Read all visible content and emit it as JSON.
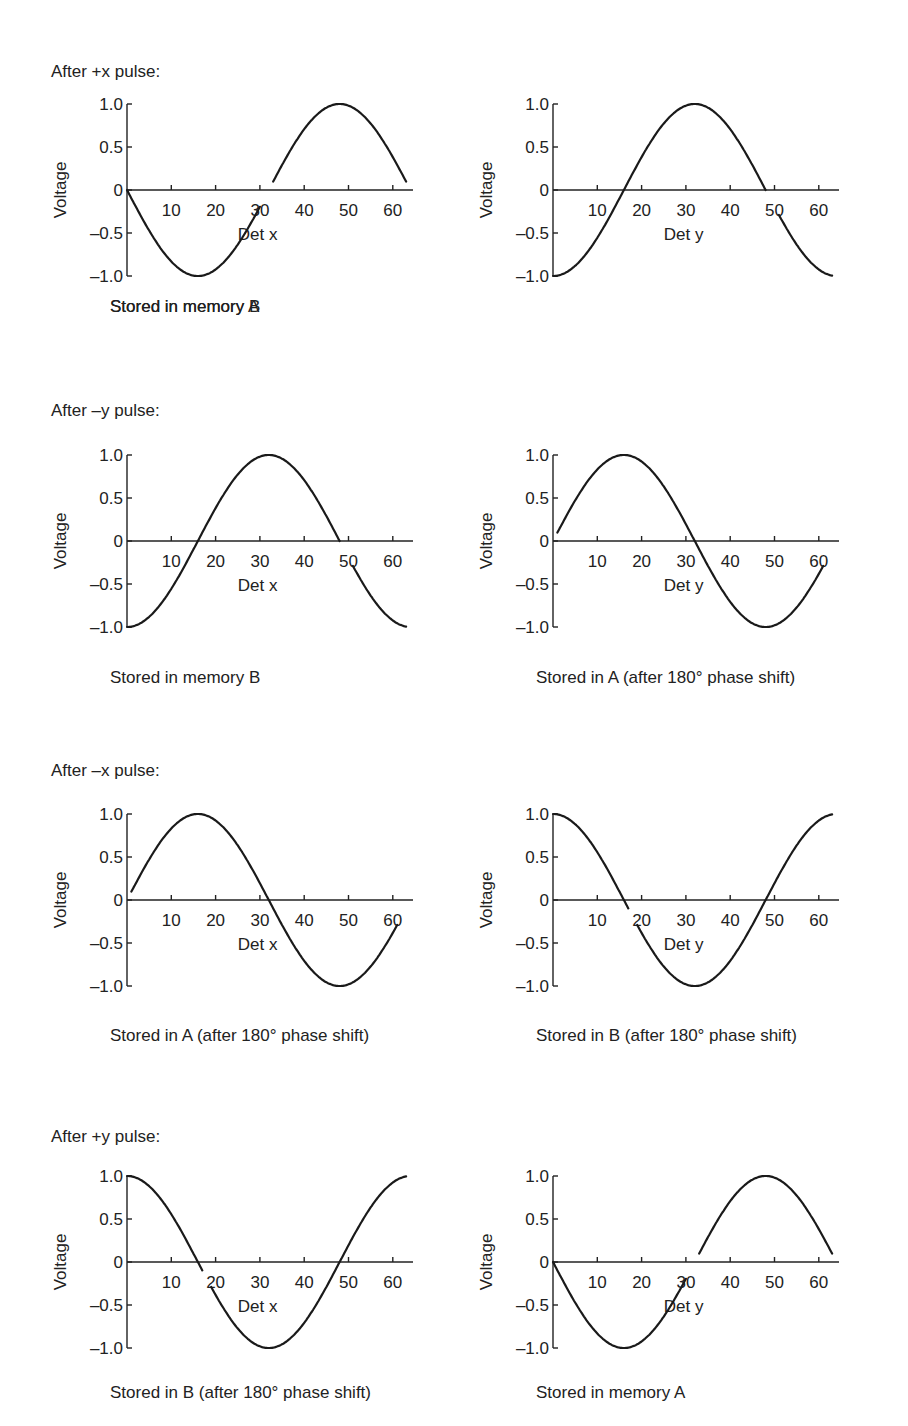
{
  "figure": {
    "rows": [
      {
        "title": "After +x pulse:"
      },
      {
        "title": "After –y pulse:"
      },
      {
        "title": "After –x pulse:"
      },
      {
        "title": "After +y pulse:"
      }
    ],
    "y_axis_label": "Voltage",
    "y_tick_labels": [
      "1.0",
      "0.5",
      "0",
      "–0.5",
      "–1.0"
    ],
    "x_tick_labels": [
      "10",
      "20",
      "30",
      "40",
      "50",
      "60"
    ]
  },
  "chart_data": [
    {
      "type": "line",
      "row": 0,
      "col": 0,
      "row_title": "After +x pulse:",
      "xlabel": "Det x",
      "ylabel": "Voltage",
      "caption": "Stored in memory A",
      "xlim": [
        0,
        64
      ],
      "ylim": [
        -1.0,
        1.0
      ],
      "xticks": [
        10,
        20,
        30,
        40,
        50,
        60
      ],
      "yticks": [
        -1.0,
        -0.5,
        0,
        0.5,
        1.0
      ],
      "function": "-sin(2*pi*x/64)",
      "x": [
        0,
        8,
        16,
        24,
        32,
        40,
        48,
        56,
        63
      ],
      "y": [
        0,
        -0.71,
        -1.0,
        -0.71,
        0,
        0.71,
        1.0,
        0.71,
        0.1
      ],
      "gap_near_label": [
        30,
        33
      ]
    },
    {
      "type": "line",
      "row": 0,
      "col": 1,
      "xlabel": "Det y",
      "ylabel": "Voltage",
      "caption": "Stored in memory B",
      "xlim": [
        0,
        64
      ],
      "ylim": [
        -1.0,
        1.0
      ],
      "xticks": [
        10,
        20,
        30,
        40,
        50,
        60
      ],
      "yticks": [
        -1.0,
        -0.5,
        0,
        0.5,
        1.0
      ],
      "function": "-cos(2*pi*x/64)",
      "x": [
        0,
        8,
        16,
        24,
        32,
        40,
        48,
        56,
        63
      ],
      "y": [
        -1.0,
        -0.71,
        0,
        0.71,
        1.0,
        0.71,
        0,
        -0.71,
        -1.0
      ],
      "gap_near_label": [
        48,
        51
      ]
    },
    {
      "type": "line",
      "row": 1,
      "col": 0,
      "row_title": "After –y pulse:",
      "xlabel": "Det x",
      "ylabel": "Voltage",
      "caption": "Stored in memory B",
      "xlim": [
        0,
        64
      ],
      "ylim": [
        -1.0,
        1.0
      ],
      "xticks": [
        10,
        20,
        30,
        40,
        50,
        60
      ],
      "yticks": [
        -1.0,
        -0.5,
        0,
        0.5,
        1.0
      ],
      "function": "-cos(2*pi*x/64)",
      "x": [
        0,
        8,
        16,
        24,
        32,
        40,
        48,
        56,
        63
      ],
      "y": [
        -1.0,
        -0.71,
        0,
        0.71,
        1.0,
        0.71,
        0,
        -0.71,
        -1.0
      ],
      "gap_near_label": [
        48,
        51
      ]
    },
    {
      "type": "line",
      "row": 1,
      "col": 1,
      "xlabel": "Det y",
      "ylabel": "Voltage",
      "caption": "Stored in A (after 180° phase shift)",
      "xlim": [
        0,
        64
      ],
      "ylim": [
        -1.0,
        1.0
      ],
      "xticks": [
        10,
        20,
        30,
        40,
        50,
        60
      ],
      "yticks": [
        -1.0,
        -0.5,
        0,
        0.5,
        1.0
      ],
      "function": "sin(2*pi*x/64)",
      "x": [
        1,
        8,
        16,
        24,
        32,
        40,
        48,
        56,
        61
      ],
      "y": [
        0,
        0.71,
        1.0,
        0.71,
        0,
        -0.71,
        -1.0,
        -0.71,
        -0.3
      ]
    },
    {
      "type": "line",
      "row": 2,
      "col": 0,
      "row_title": "After –x pulse:",
      "xlabel": "Det x",
      "ylabel": "Voltage",
      "caption": "Stored in A (after 180° phase shift)",
      "xlim": [
        0,
        64
      ],
      "ylim": [
        -1.0,
        1.0
      ],
      "xticks": [
        10,
        20,
        30,
        40,
        50,
        60
      ],
      "yticks": [
        -1.0,
        -0.5,
        0,
        0.5,
        1.0
      ],
      "function": "sin(2*pi*x/64)",
      "x": [
        1,
        8,
        16,
        24,
        32,
        40,
        48,
        56,
        61
      ],
      "y": [
        0,
        0.71,
        1.0,
        0.71,
        0,
        -0.71,
        -1.0,
        -0.71,
        -0.3
      ]
    },
    {
      "type": "line",
      "row": 2,
      "col": 1,
      "xlabel": "Det y",
      "ylabel": "Voltage",
      "caption": "Stored in B (after 180° phase shift)",
      "xlim": [
        0,
        64
      ],
      "ylim": [
        -1.0,
        1.0
      ],
      "xticks": [
        10,
        20,
        30,
        40,
        50,
        60
      ],
      "yticks": [
        -1.0,
        -0.5,
        0,
        0.5,
        1.0
      ],
      "function": "cos(2*pi*x/64)",
      "x": [
        0,
        8,
        16,
        24,
        32,
        40,
        48,
        56,
        63
      ],
      "y": [
        1.0,
        0.71,
        0,
        -0.71,
        -1.0,
        -0.71,
        0,
        0.71,
        1.0
      ],
      "gap_near_label": [
        17,
        19
      ]
    },
    {
      "type": "line",
      "row": 3,
      "col": 0,
      "row_title": "After +y pulse:",
      "xlabel": "Det x",
      "ylabel": "Voltage",
      "caption": "Stored in B (after 180° phase shift)",
      "xlim": [
        0,
        64
      ],
      "ylim": [
        -1.0,
        1.0
      ],
      "xticks": [
        10,
        20,
        30,
        40,
        50,
        60
      ],
      "yticks": [
        -1.0,
        -0.5,
        0,
        0.5,
        1.0
      ],
      "function": "cos(2*pi*x/64)",
      "x": [
        0,
        8,
        16,
        24,
        32,
        40,
        48,
        56,
        63
      ],
      "y": [
        1.0,
        0.71,
        0,
        -0.71,
        -1.0,
        -0.71,
        0,
        0.71,
        1.0
      ],
      "gap_near_label": [
        17,
        19
      ]
    },
    {
      "type": "line",
      "row": 3,
      "col": 1,
      "xlabel": "Det y",
      "ylabel": "Voltage",
      "caption": "Stored in memory A",
      "xlim": [
        0,
        64
      ],
      "ylim": [
        -1.0,
        1.0
      ],
      "xticks": [
        10,
        20,
        30,
        40,
        50,
        60
      ],
      "yticks": [
        -1.0,
        -0.5,
        0,
        0.5,
        1.0
      ],
      "function": "-sin(2*pi*x/64)",
      "x": [
        0,
        8,
        16,
        24,
        32,
        40,
        48,
        56,
        63
      ],
      "y": [
        0,
        -0.71,
        -1.0,
        -0.71,
        0,
        0.71,
        1.0,
        0.71,
        0.1
      ],
      "gap_near_label": [
        30,
        33
      ]
    }
  ]
}
